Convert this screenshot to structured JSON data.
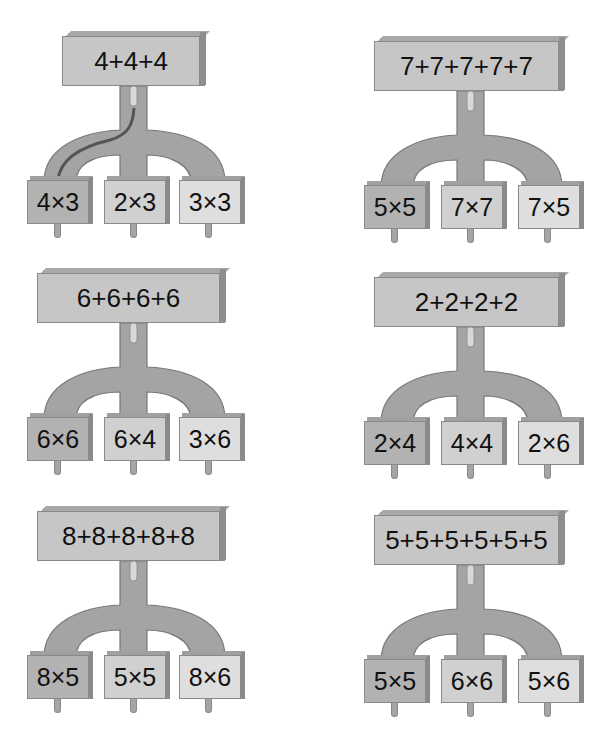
{
  "puzzles": [
    {
      "sum": "4+4+4",
      "options": [
        "4×3",
        "2×3",
        "3×3"
      ],
      "traced_path": 0
    },
    {
      "sum": "7+7+7+7+7",
      "options": [
        "5×5",
        "7×7",
        "7×5"
      ]
    },
    {
      "sum": "6+6+6+6",
      "options": [
        "6×6",
        "6×4",
        "3×6"
      ]
    },
    {
      "sum": "2+2+2+2",
      "options": [
        "2×4",
        "4×4",
        "2×6"
      ]
    },
    {
      "sum": "8+8+8+8+8",
      "options": [
        "8×5",
        "5×5",
        "8×6"
      ]
    },
    {
      "sum": "5+5+5+5+5+5",
      "options": [
        "5×5",
        "6×6",
        "5×6"
      ]
    }
  ],
  "colors": {
    "pipe": "#a4a4a4",
    "pipe_outline": "#777777",
    "top_box": "#c6c6c6",
    "option_left": "#b2b2b2",
    "option_middle": "#d0d0d0",
    "option_right": "#dedede",
    "trace": "#555555"
  }
}
